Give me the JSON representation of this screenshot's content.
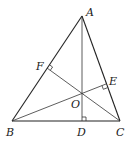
{
  "diagram": {
    "title": "",
    "points": {
      "A": {
        "label": "A",
        "x": 82,
        "y": 16
      },
      "B": {
        "label": "B",
        "x": 12,
        "y": 121
      },
      "C": {
        "label": "C",
        "x": 120,
        "y": 121
      },
      "D": {
        "label": "D",
        "x": 82,
        "y": 121
      },
      "E": {
        "label": "E",
        "x": 106,
        "y": 84
      },
      "F": {
        "label": "F",
        "x": 47,
        "y": 68
      },
      "O": {
        "label": "O",
        "x": 82,
        "y": 95
      }
    },
    "segments": [
      "AB",
      "AC",
      "BC",
      "AD",
      "BE",
      "CF"
    ],
    "right_angles": [
      "D",
      "E",
      "F"
    ],
    "label_positions": {
      "A": {
        "x": 86,
        "y": 16
      },
      "B": {
        "x": 7,
        "y": 136
      },
      "C": {
        "x": 117,
        "y": 136
      },
      "D": {
        "x": 77,
        "y": 136
      },
      "E": {
        "x": 110,
        "y": 84
      },
      "F": {
        "x": 36,
        "y": 69
      },
      "O": {
        "x": 71,
        "y": 107
      }
    }
  }
}
